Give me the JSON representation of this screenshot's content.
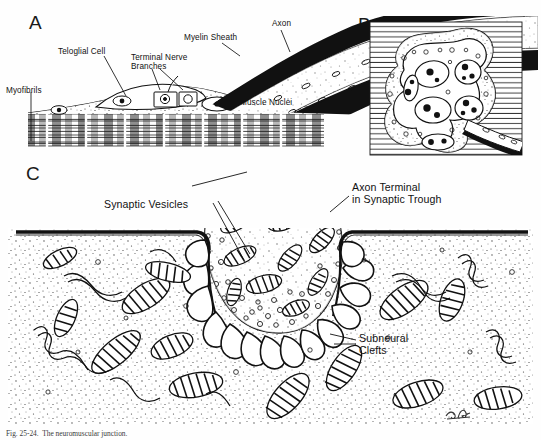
{
  "figure": {
    "title_caption": "Fig. 25-24.  The neuromuscular junction.",
    "signature": "cRr",
    "ink_color": "#111111",
    "paper_color": "#fefefe"
  },
  "panels": [
    {
      "id": "A",
      "letter": "A",
      "description": "Longitudinal section of motor end plate on skeletal muscle fiber",
      "labels": [
        {
          "name": "myofibrils",
          "text": "Myofibrils",
          "x": 6,
          "y": 86
        },
        {
          "name": "teloglial-cell",
          "text": "Teloglial Cell",
          "x": 58,
          "y": 47
        },
        {
          "name": "terminal-nerve-branches",
          "text": "Terminal Nerve\nBranches",
          "x": 131,
          "y": 53
        },
        {
          "name": "myelin-sheath",
          "text": "Myelin Sheath",
          "x": 184,
          "y": 33
        },
        {
          "name": "axon",
          "text": "Axon",
          "x": 272,
          "y": 19
        },
        {
          "name": "muscle-nuclei",
          "text": "Muscle Nuclei",
          "x": 240,
          "y": 98
        }
      ]
    },
    {
      "id": "B",
      "letter": "B",
      "description": "Surface view of motor end plate showing branching axon terminals over muscle fiber",
      "labels": []
    },
    {
      "id": "C",
      "letter": "C",
      "description": "Electron-microscopic detail of axon terminal within synaptic trough",
      "labels": [
        {
          "name": "synaptic-vesicles",
          "text": "Synaptic Vesicles",
          "x": 104,
          "y": 199
        },
        {
          "name": "axon-terminal-in-synaptic-trough",
          "text": "Axon Terminal\nin Synaptic Trough",
          "x": 352,
          "y": 182
        },
        {
          "name": "subneural-clefts",
          "text": "Subneural\nClefts",
          "x": 359,
          "y": 333
        }
      ]
    }
  ]
}
